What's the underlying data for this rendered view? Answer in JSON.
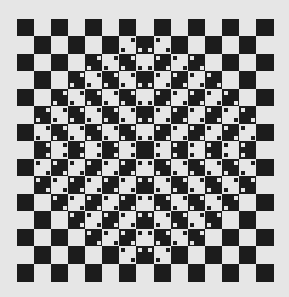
{
  "image": {
    "title": "Checkerboard bulge optical illusion",
    "caption_fragment": "",
    "background_color": "#e6e6e6",
    "dark_color": "#1c1c1c",
    "light_color": "#e6e6e6"
  },
  "board": {
    "rows": 15,
    "cols": 15,
    "first_cell": "dark",
    "center": [
      7,
      7
    ],
    "decorated_half_width_per_row": [
      -1,
      1,
      3,
      4,
      5,
      6,
      6,
      6,
      6,
      6,
      5,
      4,
      3,
      1,
      -1
    ],
    "dot_rule": {
      "same_row_left": [
        "top-right",
        "bottom-right"
      ],
      "same_row_right": [
        "top-left",
        "bottom-left"
      ],
      "same_col_above": [
        "bottom-left",
        "bottom-right"
      ],
      "same_col_below": [
        "top-left",
        "top-right"
      ],
      "upper_left": [
        "top-right",
        "bottom-left"
      ],
      "upper_right": [
        "top-left",
        "bottom-right"
      ],
      "lower_left": [
        "top-left",
        "bottom-right"
      ],
      "lower_right": [
        "top-right",
        "bottom-left"
      ]
    },
    "dot_color": "opposite-of-cell"
  }
}
